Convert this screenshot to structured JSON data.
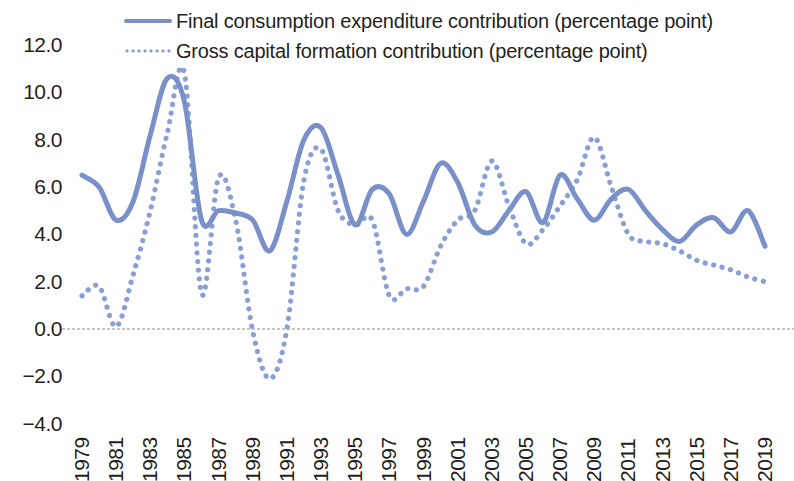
{
  "legend": {
    "position": "top-left",
    "entries": [
      {
        "label": "Final consumption expenditure contribution (percentage point)",
        "style": "solid",
        "color": "#7a90c8"
      },
      {
        "label": "Gross capital formation contribution (percentage point)",
        "style": "dotted",
        "color": "#8aa0d4"
      }
    ]
  },
  "axes": {
    "y_ticks": [
      "12.0",
      "10.0",
      "8.0",
      "6.0",
      "4.0",
      "2.0",
      "0.0",
      "-2.0",
      "-4.0"
    ],
    "x_ticks": [
      "1979",
      "1981",
      "1983",
      "1985",
      "1987",
      "1989",
      "1991",
      "1993",
      "1995",
      "1997",
      "1999",
      "2001",
      "2003",
      "2005",
      "2007",
      "2009",
      "2011",
      "2013",
      "2015",
      "2017",
      "2019"
    ]
  },
  "colors": {
    "series_solid": "#7a90c8",
    "series_dotted": "#8aa0d4",
    "zero_line": "#b3b3b3",
    "text": "#231f20",
    "background": "#ffffff"
  },
  "chart_data": {
    "type": "line",
    "title": "",
    "subtitle": "",
    "xlabel": "",
    "ylabel": "",
    "xlim": [
      1979,
      2019
    ],
    "ylim": [
      -4.0,
      12.0
    ],
    "y_tick_step": 2.0,
    "x_tick_step": 2,
    "grid": false,
    "zero_line": true,
    "legend_position": "top-left",
    "x": [
      1979,
      1980,
      1981,
      1982,
      1983,
      1984,
      1985,
      1986,
      1987,
      1988,
      1989,
      1990,
      1991,
      1992,
      1993,
      1994,
      1995,
      1996,
      1997,
      1998,
      1999,
      2000,
      2001,
      2002,
      2003,
      2004,
      2005,
      2006,
      2007,
      2008,
      2009,
      2010,
      2011,
      2012,
      2013,
      2014,
      2015,
      2016,
      2017,
      2018,
      2019
    ],
    "series": [
      {
        "name": "Final consumption expenditure contribution (percentage point)",
        "style": "solid",
        "color": "#7a90c8",
        "values": [
          6.5,
          6.0,
          4.6,
          5.4,
          8.2,
          10.6,
          9.6,
          4.6,
          5.0,
          4.9,
          4.6,
          3.3,
          5.4,
          8.0,
          8.5,
          6.5,
          4.4,
          5.9,
          5.7,
          4.0,
          5.4,
          7.0,
          6.2,
          4.4,
          4.1,
          5.0,
          5.8,
          4.5,
          6.5,
          5.5,
          4.6,
          5.5,
          5.9,
          5.0,
          4.2,
          3.7,
          4.4,
          4.7,
          4.1,
          5.0,
          3.5
        ]
      },
      {
        "name": "Gross capital formation contribution (percentage point)",
        "style": "dotted",
        "color": "#8aa0d4",
        "values": [
          1.4,
          1.8,
          0.1,
          2.3,
          5.0,
          8.3,
          10.8,
          1.5,
          6.4,
          4.6,
          -0.1,
          -2.1,
          0.0,
          6.3,
          7.6,
          5.0,
          4.4,
          4.6,
          1.4,
          1.7,
          1.8,
          3.5,
          4.6,
          5.0,
          7.1,
          5.2,
          3.6,
          4.2,
          5.2,
          6.3,
          8.1,
          6.0,
          4.0,
          3.7,
          3.6,
          3.3,
          2.9,
          2.7,
          2.5,
          2.2,
          2.0
        ]
      }
    ]
  }
}
